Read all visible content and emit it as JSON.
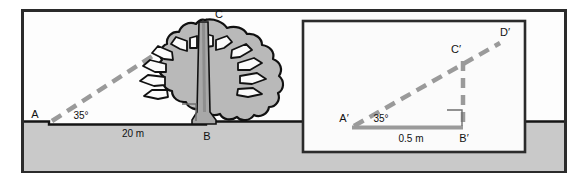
{
  "figure": {
    "title": "Tree height by angle of elevation with scale model inset",
    "colors": {
      "frame_border": "#2b2b2b",
      "scene_background": "#fdfdfd",
      "ground_fill": "#c9c9c9",
      "ground_line": "#141414",
      "sight_line": "#9a9a9a",
      "tree_outline": "#111111",
      "tree_fill": "#b9b9b9",
      "trunk_fill": "#a8a8a8",
      "inset_background": "#fbfbfb",
      "inset_border": "#2b2b2b",
      "text": "#111111"
    }
  },
  "main_scene": {
    "name": "real-world-tree-scene",
    "points": {
      "A": "A",
      "B": "B",
      "C": "C"
    },
    "angle": "35°",
    "baseline_length": "20 m",
    "right_angle_at": "B"
  },
  "inset_scene": {
    "name": "scale-model-triangle",
    "points": {
      "A_prime": "A′",
      "B_prime": "B′",
      "C_prime": "C′",
      "D_prime": "D′"
    },
    "angle": "35°",
    "baseline_length": "0.5 m",
    "right_angle_at": "B′"
  }
}
